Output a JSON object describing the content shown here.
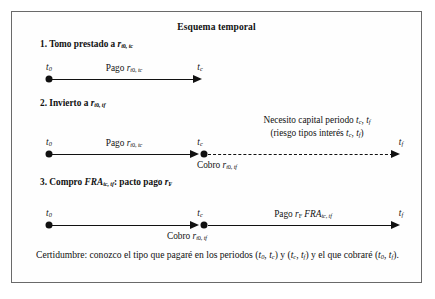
{
  "figure": {
    "title": "Esquema temporal",
    "steps": [
      {
        "id": "step-1",
        "heading_prefix": "1. Tomo prestado a ",
        "heading_var": "r",
        "heading_sub": "t0, tc",
        "axis_label": "Pago ",
        "axis_var": "r",
        "axis_sub": "t0, tc",
        "tick_start": "t0",
        "tick_end": "tc"
      },
      {
        "id": "step-2",
        "heading_prefix": "2. Invierto a ",
        "heading_var": "r",
        "heading_sub": "t0, tf",
        "axis_label": "Pago ",
        "axis_var": "r",
        "axis_sub": "t0, tc",
        "below_label": "Cobro ",
        "below_var": "r",
        "below_sub": "t0, tf",
        "note_line1": "Necesito capital periodo tc, tf",
        "note_line2": "(riesgo tipos interes tc, tf)",
        "tick_start": "t0",
        "tick_mid": "tc",
        "tick_end": "tf"
      },
      {
        "id": "step-3",
        "heading_prefix": "3. Compro ",
        "heading_var": "FRA",
        "heading_sub": "tc, tf",
        "heading_suffix": ": pacto pago ",
        "heading_var2": "r",
        "heading_sub2": "F",
        "axis_label": "Pago ",
        "axis_var": "rF FRA",
        "axis_sub": "tc, tf",
        "below_label": "Cobro ",
        "below_var": "r",
        "below_sub": "t0, tf",
        "tick_start": "t0",
        "tick_mid": "tc",
        "tick_end": "tf"
      }
    ],
    "conclusion": "Certidumbre: conozco el tipo que pagare en los periodos (t0, tc) y (tc, tf) y el que cobrare (t0, tf)."
  }
}
